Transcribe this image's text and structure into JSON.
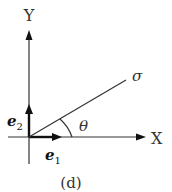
{
  "diagram": {
    "axes": {
      "y_label": "Y",
      "x_label": "X"
    },
    "vectors": {
      "e2_base": "e",
      "e2_sub": "2",
      "e1_base": "e",
      "e1_sub": "1"
    },
    "ray_label": "σ",
    "angle_label": "θ",
    "caption": "(d)",
    "colors": {
      "line": "#333333",
      "background": "#ffffff"
    }
  }
}
